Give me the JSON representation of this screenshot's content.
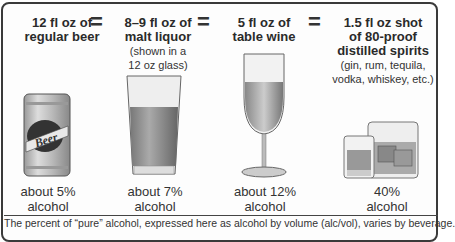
{
  "drinks": [
    {
      "title_line1": "12 fl oz of",
      "title_line2": "regular beer",
      "note": "",
      "pct_line1": "about 5%",
      "pct_line2": "alcohol",
      "icon": "beer-can-icon"
    },
    {
      "title_line1": "8–9 fl oz of",
      "title_line2": "malt liquor",
      "note_line1": "(shown in a",
      "note_line2": "12 oz glass)",
      "pct_line1": "about 7%",
      "pct_line2": "alcohol",
      "icon": "pint-glass-icon"
    },
    {
      "title_line1": "5 fl oz of",
      "title_line2": "table wine",
      "pct_line1": "about 12%",
      "pct_line2": "alcohol",
      "icon": "wine-glass-icon"
    },
    {
      "title_line1": "1.5 fl oz shot",
      "title_line2": "of 80-proof",
      "title_line3": "distilled spirits",
      "note_line1": "(gin, rum, tequila,",
      "note_line2": "vodka, whiskey, etc.)",
      "pct_line1": "40%",
      "pct_line2": "alcohol",
      "icon": "shot-glass-icon"
    }
  ],
  "equals": "=",
  "beer_label": "Beer",
  "footnote": "The percent of “pure” alcohol, expressed here as alcohol by volume (alc/vol), varies by beverage."
}
